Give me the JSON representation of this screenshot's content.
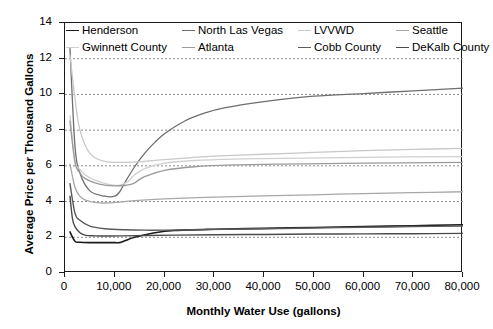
{
  "chart_data": {
    "type": "line",
    "title": "",
    "xlabel": "Monthly Water Use (gallons)",
    "ylabel": "Average Price per Thousand Gallons",
    "xlim": [
      0,
      80000
    ],
    "ylim": [
      0,
      14
    ],
    "xticks": [
      0,
      10000,
      20000,
      30000,
      40000,
      50000,
      60000,
      70000,
      80000
    ],
    "xticklabels": [
      "0",
      "10,000",
      "20,000",
      "30,000",
      "40,000",
      "50,000",
      "60,000",
      "70,000",
      "80,000"
    ],
    "yticks": [
      0,
      2,
      4,
      6,
      8,
      10,
      12,
      14
    ],
    "yticklabels": [
      "0",
      "2",
      "4",
      "6",
      "8",
      "10",
      "12",
      "14"
    ],
    "grid": "horizontal-dotted",
    "legend_position": "top-inside",
    "series": [
      {
        "name": "Henderson",
        "color": "#1a1a1a",
        "width": 1.6,
        "x": [
          1000,
          2000,
          3000,
          5000,
          8000,
          10000,
          11000,
          12000,
          14000,
          18000,
          22000,
          30000,
          40000,
          50000,
          60000,
          70000,
          80000
        ],
        "y": [
          2.3,
          1.78,
          1.72,
          1.7,
          1.7,
          1.7,
          1.7,
          1.8,
          2.0,
          2.25,
          2.38,
          2.45,
          2.5,
          2.55,
          2.6,
          2.65,
          2.7
        ]
      },
      {
        "name": "North Las Vegas",
        "color": "#6e6e6e",
        "width": 1.3,
        "x": [
          1000,
          2000,
          3000,
          5000,
          8000,
          10000,
          11000,
          12000,
          14000,
          16000,
          18000,
          20000,
          24000,
          28000,
          32000,
          40000,
          50000,
          60000,
          70000,
          80000
        ],
        "y": [
          12.6,
          7.1,
          5.6,
          4.6,
          4.3,
          4.3,
          4.55,
          5.05,
          5.95,
          6.7,
          7.3,
          7.8,
          8.5,
          8.95,
          9.25,
          9.6,
          9.9,
          10.05,
          10.2,
          10.35
        ]
      },
      {
        "name": "LVVWD",
        "color": "#c8c8c8",
        "width": 1.3,
        "x": [
          1000,
          2000,
          3000,
          5000,
          8000,
          12000,
          16000,
          20000,
          25000,
          30000,
          40000,
          50000,
          60000,
          70000,
          80000
        ],
        "y": [
          12.2,
          9.8,
          8.0,
          6.7,
          6.25,
          6.2,
          6.25,
          6.35,
          6.45,
          6.55,
          6.65,
          6.75,
          6.85,
          6.92,
          6.98
        ]
      },
      {
        "name": "Seattle",
        "color": "#a8a8a8",
        "width": 1.3,
        "x": [
          1000,
          2000,
          3000,
          4000,
          6000,
          8000,
          10000,
          14000,
          20000,
          30000,
          40000,
          50000,
          60000,
          70000,
          80000
        ],
        "y": [
          6.1,
          4.8,
          4.3,
          4.1,
          3.95,
          3.92,
          3.95,
          4.05,
          4.15,
          4.25,
          4.32,
          4.38,
          4.45,
          4.5,
          4.55
        ]
      },
      {
        "name": "Gwinnett County",
        "color": "#cfcfcf",
        "width": 1.3,
        "x": [
          1000,
          2000,
          3000,
          4000,
          6000,
          9000,
          11000,
          12500,
          13000,
          14000,
          16000,
          20000,
          26000,
          34000,
          44000,
          60000,
          80000
        ],
        "y": [
          8.8,
          6.3,
          5.8,
          5.5,
          5.2,
          4.95,
          4.92,
          5.1,
          5.2,
          5.5,
          5.85,
          6.15,
          6.3,
          6.38,
          6.42,
          6.48,
          6.52
        ]
      },
      {
        "name": "Atlanta",
        "color": "#9a9a9a",
        "width": 1.3,
        "x": [
          1000,
          2000,
          3000,
          4000,
          6000,
          8000,
          10000,
          12000,
          13000,
          14000,
          16000,
          20000,
          26000,
          34000,
          44000,
          60000,
          80000
        ],
        "y": [
          8.5,
          6.2,
          5.6,
          5.3,
          5.05,
          4.92,
          4.88,
          4.9,
          4.95,
          5.05,
          5.4,
          5.75,
          5.95,
          6.05,
          6.1,
          6.15,
          6.2
        ]
      },
      {
        "name": "Cobb County",
        "color": "#5a5a5a",
        "width": 1.4,
        "x": [
          1000,
          2000,
          3000,
          5000,
          8000,
          12000,
          16000,
          20000,
          26000,
          32000,
          40000,
          50000,
          60000,
          70000,
          80000
        ],
        "y": [
          5.0,
          3.35,
          2.95,
          2.62,
          2.48,
          2.42,
          2.4,
          2.4,
          2.42,
          2.45,
          2.48,
          2.52,
          2.56,
          2.6,
          2.63
        ]
      },
      {
        "name": "DeKalb County",
        "color": "#4a4a4a",
        "width": 1.4,
        "x": [
          1000,
          1500,
          2000,
          3000,
          4000,
          6000,
          9000,
          12000,
          16000,
          22000,
          30000,
          40000,
          50000,
          60000,
          70000,
          80000
        ],
        "y": [
          4.3,
          3.05,
          2.6,
          2.25,
          2.12,
          2.08,
          2.07,
          2.08,
          2.1,
          2.12,
          2.14,
          2.16,
          2.18,
          2.19,
          2.2,
          2.22
        ]
      }
    ],
    "legend_rows": [
      [
        "Henderson",
        "North Las Vegas",
        "LVVWD",
        "Seattle"
      ],
      [
        "Gwinnett County",
        "Atlanta",
        "Cobb County",
        "DeKalb County"
      ]
    ]
  }
}
